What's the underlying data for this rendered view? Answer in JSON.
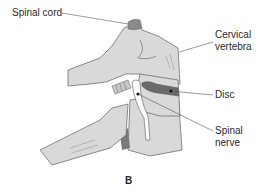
{
  "figure": {
    "panel_letter": "B",
    "labels": {
      "spinal_cord": "Spinal cord",
      "cervical_vertebra_line1": "Cervical",
      "cervical_vertebra_line2": "vertebra",
      "disc": "Disc",
      "spinal_nerve_line1": "Spinal",
      "spinal_nerve_line2": "nerve"
    },
    "colors": {
      "bone_fill": "#d9d9d9",
      "bone_stroke": "#6e6e6e",
      "disc_fill": "#6a6a6a",
      "cord_fill": "#8a8a8a",
      "nerve_fill": "#ffffff",
      "leader_line": "#555555",
      "text": "#2a2a2a"
    }
  }
}
